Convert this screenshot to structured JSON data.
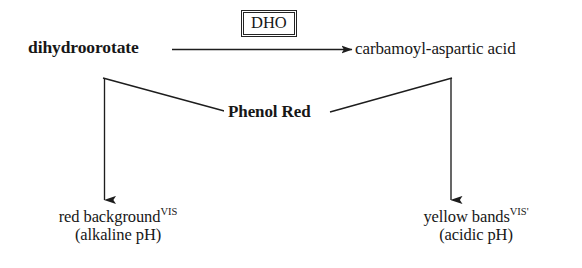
{
  "diagram": {
    "type": "reaction-scheme",
    "background_color": "#ffffff",
    "ink_color": "#171717",
    "reaction": {
      "substrate": "dihydroorotate",
      "product": "carbamoyl-aspartic acid",
      "enzyme_box": "DHO",
      "indicator": "Phenol Red"
    },
    "outcomes": {
      "left": {
        "text": "red background",
        "superscript": "VIS",
        "condition": "(alkaline pH)"
      },
      "right": {
        "text": "yellow bands",
        "superscript": "VIS'",
        "condition": "(acidic pH)"
      }
    }
  }
}
